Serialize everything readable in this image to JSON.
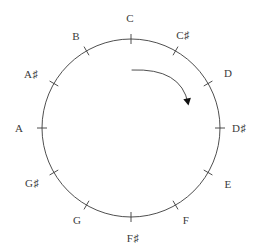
{
  "figure": {
    "name": "chromatic-circle",
    "background_color": "#ffffff",
    "stroke_color": "#3b3b3b",
    "label_color": "#3b3b3b",
    "circle": {
      "center_x": 131,
      "center_y": 128,
      "radius": 89,
      "stroke_width": 0.9
    },
    "tick": {
      "inner_offset": 5,
      "outer_offset": 5,
      "stroke_width": 0.9,
      "count": 12
    },
    "arrow": {
      "name": "clockwise-direction-arrow",
      "direction": "clockwise",
      "start_x": 132,
      "start_y": 70,
      "end_x": 188,
      "end_y": 103,
      "control_x": 181,
      "control_y": 68,
      "head_size": 7,
      "stroke_width": 0.9
    }
  },
  "chart_data": {
    "type": "scatter",
    "xlabel": "",
    "ylabel": "",
    "notes": [
      {
        "label": "C",
        "letter": "C",
        "accidental": "",
        "pitch_class": 0,
        "angle_deg": 0,
        "label_radius": 110,
        "label_x": 130,
        "label_y": 18
      },
      {
        "label": "C♯",
        "letter": "C",
        "accidental": "♯",
        "pitch_class": 1,
        "angle_deg": 30,
        "label_radius": 110,
        "label_x": 183,
        "label_y": 35
      },
      {
        "label": "D",
        "letter": "D",
        "accidental": "",
        "pitch_class": 2,
        "angle_deg": 60,
        "label_radius": 110,
        "label_x": 228,
        "label_y": 73
      },
      {
        "label": "D♯",
        "letter": "D",
        "accidental": "♯",
        "pitch_class": 3,
        "angle_deg": 90,
        "label_radius": 110,
        "label_x": 239,
        "label_y": 128
      },
      {
        "label": "E",
        "letter": "E",
        "accidental": "",
        "pitch_class": 4,
        "angle_deg": 120,
        "label_radius": 110,
        "label_x": 228,
        "label_y": 184
      },
      {
        "label": "F",
        "letter": "F",
        "accidental": "",
        "pitch_class": 5,
        "angle_deg": 150,
        "label_radius": 110,
        "label_x": 186,
        "label_y": 220
      },
      {
        "label": "F♯",
        "letter": "F",
        "accidental": "♯",
        "pitch_class": 6,
        "angle_deg": 180,
        "label_radius": 110,
        "label_x": 133,
        "label_y": 238
      },
      {
        "label": "G",
        "letter": "G",
        "accidental": "",
        "pitch_class": 7,
        "angle_deg": 210,
        "label_radius": 110,
        "label_x": 77,
        "label_y": 220
      },
      {
        "label": "G♯",
        "letter": "G",
        "accidental": "♯",
        "pitch_class": 8,
        "angle_deg": 240,
        "label_radius": 110,
        "label_x": 32,
        "label_y": 183
      },
      {
        "label": "A",
        "letter": "A",
        "accidental": "",
        "pitch_class": 9,
        "angle_deg": 270,
        "label_radius": 110,
        "label_x": 19,
        "label_y": 128
      },
      {
        "label": "A♯",
        "letter": "A",
        "accidental": "♯",
        "pitch_class": 10,
        "angle_deg": 300,
        "label_radius": 110,
        "label_x": 31,
        "label_y": 74
      },
      {
        "label": "B",
        "letter": "B",
        "accidental": "",
        "pitch_class": 11,
        "angle_deg": 330,
        "label_radius": 110,
        "label_x": 76,
        "label_y": 36
      }
    ],
    "annotations": [
      {
        "name": "clockwise-arrow",
        "text": "",
        "meaning": "ascending semitone direction"
      }
    ],
    "legend": [],
    "grid": false
  }
}
